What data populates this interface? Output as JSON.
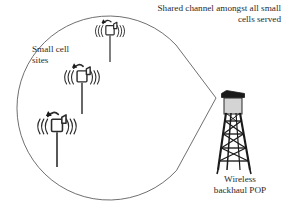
{
  "figure": {
    "type": "network-topology-diagram",
    "background_color": "#ffffff",
    "stroke_color": "#2b2b2b",
    "labels": {
      "shared_channel": "Shared channel amongst all small\ncells served",
      "small_cell_sites": "Small cell\nsites",
      "wireless_backhaul_pop": "Wireless\nbackhaul POP"
    },
    "coverage_region": {
      "name": "teardrop-coverage-area",
      "shape": "circle-with-converging-tangents",
      "circle": {
        "cx": 100,
        "cy": 108,
        "r": 92
      },
      "apex": {
        "x": 216,
        "y": 98
      }
    },
    "small_cells": [
      {
        "id": "small-cell-top",
        "x": 110,
        "y": 30,
        "mast_height": 32,
        "scale": 0.8,
        "waves": 3
      },
      {
        "id": "small-cell-middle",
        "x": 82,
        "y": 76,
        "mast_height": 40,
        "scale": 0.95,
        "waves": 3
      },
      {
        "id": "small-cell-bottom",
        "x": 57,
        "y": 125,
        "mast_height": 48,
        "scale": 1.05,
        "waves": 3
      }
    ],
    "tower": {
      "id": "wireless-backhaul-tower",
      "x": 234,
      "top_y": 92,
      "base_y": 170,
      "cap_color": "#1a1a1a",
      "box_color": "#d4d4d4"
    }
  }
}
